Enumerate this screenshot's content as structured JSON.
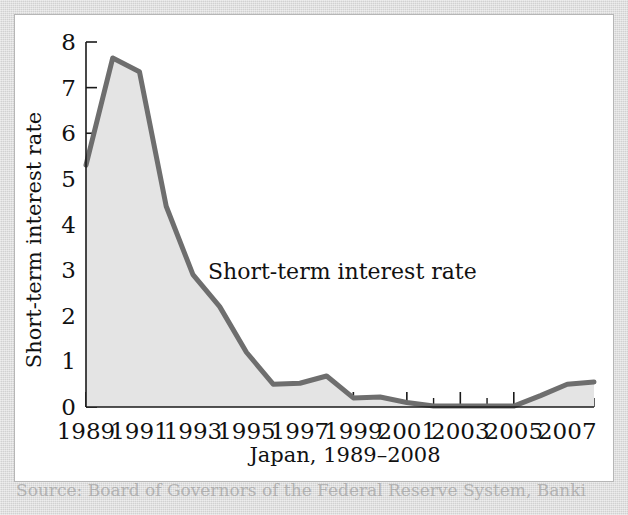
{
  "figure": {
    "source_note": "Source: Board of Governors of the Federal Reserve System, Banki"
  },
  "chart_data": {
    "type": "area",
    "title": "",
    "series_label": "Short-term interest rate",
    "xlabel": "Japan, 1989–2008",
    "ylabel": "Short-term interest rate",
    "x": [
      1989,
      1990,
      1991,
      1992,
      1993,
      1994,
      1995,
      1996,
      1997,
      1998,
      1999,
      2000,
      2001,
      2002,
      2003,
      2004,
      2005,
      2006,
      2007,
      2008
    ],
    "values": [
      5.3,
      7.65,
      7.35,
      4.4,
      2.9,
      2.2,
      1.2,
      0.5,
      0.52,
      0.68,
      0.2,
      0.22,
      0.1,
      0.02,
      0.02,
      0.02,
      0.02,
      0.25,
      0.5,
      0.55
    ],
    "xlim": [
      1989,
      2008
    ],
    "ylim": [
      0,
      8
    ],
    "ytick_labels": [
      "0",
      "1",
      "2",
      "3",
      "4",
      "5",
      "6",
      "7",
      "8"
    ],
    "ytick_values": [
      0,
      1,
      2,
      3,
      4,
      5,
      6,
      7,
      8
    ],
    "xtick_labels": [
      "1989",
      "1991",
      "1993",
      "1995",
      "1997",
      "1999",
      "2001",
      "2003",
      "2005",
      "2007"
    ],
    "xtick_values": [
      1989,
      1991,
      1993,
      1995,
      1997,
      1999,
      2001,
      2003,
      2005,
      2007
    ],
    "grid": false,
    "legend_position": "inline-annotation",
    "colors": {
      "fill": "#e4e4e4",
      "line": "#6e6e6e",
      "axis": "#1a1a1a",
      "plot_background": "#ffffff",
      "page_background": "#d9d9d9"
    }
  }
}
